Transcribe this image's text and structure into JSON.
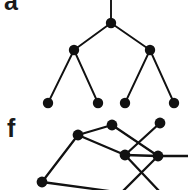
{
  "figure": {
    "width": 188,
    "height": 190,
    "background_color": "#ffffff",
    "ink_color": "#111111",
    "panels": [
      {
        "id": "panel-a",
        "label": "a",
        "label_x": 4,
        "label_y": 3,
        "type": "tree",
        "description": "rooted binary tree, three levels, root edge continues above the top crop edge"
      },
      {
        "id": "panel-f",
        "label": "f",
        "label_x": 7,
        "label_y": 128,
        "type": "graph",
        "description": "non-planar style graph drawing with crossing edges, clipped at bottom and right edges"
      }
    ],
    "tree": {
      "node_radius": 5.2,
      "edge_width": 1.9,
      "nodes": [
        {
          "id": "t-root",
          "x": 111,
          "y": 23,
          "level": 0
        },
        {
          "id": "t-l",
          "x": 74,
          "y": 50,
          "level": 1
        },
        {
          "id": "t-r",
          "x": 150,
          "y": 50,
          "level": 1
        },
        {
          "id": "t-ll",
          "x": 48,
          "y": 103,
          "level": 2
        },
        {
          "id": "t-lr",
          "x": 98,
          "y": 103,
          "level": 2
        },
        {
          "id": "t-rl",
          "x": 125,
          "y": 103,
          "level": 2
        },
        {
          "id": "t-rr",
          "x": 174,
          "y": 103,
          "level": 2
        }
      ],
      "edges": [
        {
          "from": "t-root",
          "to": "t-l"
        },
        {
          "from": "t-root",
          "to": "t-r"
        },
        {
          "from": "t-l",
          "to": "t-ll"
        },
        {
          "from": "t-l",
          "to": "t-lr"
        },
        {
          "from": "t-r",
          "to": "t-rl"
        },
        {
          "from": "t-r",
          "to": "t-rr"
        }
      ],
      "open_edges": [
        {
          "from": "t-root",
          "to_x": 111,
          "to_y": -2,
          "note": "stem above root leaves the frame"
        }
      ]
    },
    "graph": {
      "node_radius": 5.4,
      "edge_width": 2.3,
      "nodes": [
        {
          "id": "g-a",
          "x": 78,
          "y": 135
        },
        {
          "id": "g-b",
          "x": 112,
          "y": 125
        },
        {
          "id": "g-c",
          "x": 160,
          "y": 123
        },
        {
          "id": "g-d",
          "x": 125,
          "y": 155
        },
        {
          "id": "g-e",
          "x": 158,
          "y": 156
        },
        {
          "id": "g-f",
          "x": 42,
          "y": 182
        }
      ],
      "edges": [
        {
          "from": "g-a",
          "to": "g-b"
        },
        {
          "from": "g-a",
          "to": "g-d"
        },
        {
          "from": "g-a",
          "to": "g-f"
        },
        {
          "from": "g-b",
          "to": "g-e"
        },
        {
          "from": "g-c",
          "to": "g-d"
        },
        {
          "from": "g-d",
          "to": "g-e"
        }
      ],
      "open_edges": [
        {
          "from": "g-e",
          "to_x": 192,
          "to_y": 156,
          "note": "horizontal edge exits right frame"
        },
        {
          "from": "g-d",
          "to_x": 160,
          "to_y": 192,
          "note": "edge exits bottom frame"
        },
        {
          "from": "g-e",
          "to_x": 122,
          "to_y": 192,
          "note": "edge exits bottom frame"
        },
        {
          "from": "g-f",
          "to_x": 116,
          "to_y": 192,
          "note": "edge exits bottom frame"
        }
      ]
    }
  }
}
